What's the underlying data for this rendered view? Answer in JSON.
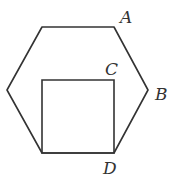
{
  "diagram": {
    "type": "geometry",
    "shapes": [
      {
        "name": "regular-hexagon",
        "vertices": [
          [
            42,
            27
          ],
          [
            114,
            27
          ],
          [
            148,
            90
          ],
          [
            114,
            153
          ],
          [
            42,
            153
          ],
          [
            7,
            90
          ]
        ]
      },
      {
        "name": "square",
        "vertices": [
          [
            42,
            80
          ],
          [
            114,
            80
          ],
          [
            114,
            153
          ],
          [
            42,
            153
          ]
        ]
      }
    ],
    "labels": {
      "A": "A",
      "B": "B",
      "C": "C",
      "D": "D"
    },
    "colors": {
      "stroke": "#333333",
      "background": "#ffffff"
    }
  }
}
